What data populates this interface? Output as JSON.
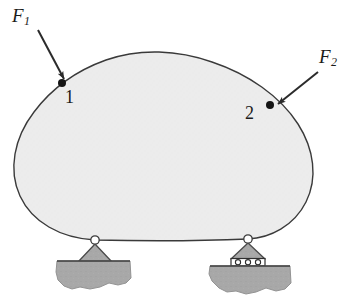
{
  "figure": {
    "type": "free-body-diagram",
    "background_color": "#ffffff",
    "body": {
      "name": "rigid-body-blob",
      "fill_color": "#ececec",
      "stroke_color": "#3a3a3a",
      "stroke_width": 1.4
    },
    "forces": [
      {
        "id": "F1",
        "label": "F",
        "subscript": "1",
        "applied_at_point": "1",
        "arrow_from": [
          38,
          30
        ],
        "arrow_to": [
          68,
          84
        ],
        "direction": "down-right"
      },
      {
        "id": "F2",
        "label": "F",
        "subscript": "2",
        "applied_at_point": "2",
        "arrow_from": [
          318,
          72
        ],
        "arrow_to": [
          274,
          107
        ],
        "direction": "down-left"
      }
    ],
    "points": [
      {
        "id": "1",
        "label": "1",
        "x": 62,
        "y": 83,
        "marker": "filled-dot"
      },
      {
        "id": "2",
        "label": "2",
        "x": 270,
        "y": 105,
        "marker": "filled-dot"
      }
    ],
    "supports": [
      {
        "id": "left-support",
        "type": "pin",
        "pin_x": 95,
        "pin_y": 240,
        "triangle_half_width": 18,
        "triangle_height": 22,
        "ground_color": "#a8a8a8",
        "triangle_color": "#a8a8a8"
      },
      {
        "id": "right-support",
        "type": "roller",
        "pin_x": 248,
        "pin_y": 239,
        "triangle_half_width": 18,
        "triangle_height": 20,
        "roller_count": 3,
        "ground_color": "#a8a8a8",
        "triangle_color": "#a8a8a8"
      }
    ],
    "colors": {
      "outline": "#3a3a3a",
      "body_fill": "#ececec",
      "ground_fill": "#a8a8a8",
      "ground_stroke": "#8f8f8f",
      "arrow": "#2b2b2b",
      "text": "#1b1b1b"
    }
  }
}
